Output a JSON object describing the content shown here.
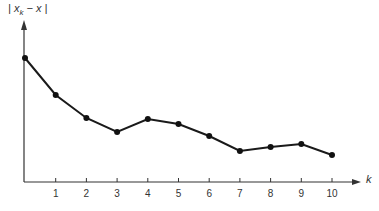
{
  "chart_data": {
    "type": "line",
    "title": "",
    "xlabel": "k",
    "ylabel": "|x_k − x|",
    "x": [
      0,
      1,
      2,
      3,
      4,
      5,
      6,
      7,
      8,
      9,
      10
    ],
    "categories": [
      "",
      "1",
      "2",
      "3",
      "4",
      "5",
      "6",
      "7",
      "8",
      "9",
      "10"
    ],
    "series": [
      {
        "name": "|x_k − x|",
        "values": [
          12.4,
          8.7,
          6.4,
          5.0,
          6.3,
          5.8,
          4.6,
          3.1,
          3.5,
          3.8,
          2.7
        ]
      }
    ],
    "ylim": [
      0,
      18
    ],
    "xlim": [
      0,
      10.5
    ],
    "grid": false,
    "legend": "none",
    "y_ticks": [],
    "x_ticks": [
      "1",
      "2",
      "3",
      "4",
      "5",
      "6",
      "7",
      "8",
      "9",
      "10"
    ],
    "colors": {
      "line": "#1a1a1a",
      "axis": "#333333",
      "marker": "#111111"
    }
  },
  "labels": {
    "y_axis_main": "| x",
    "y_axis_sub": "k",
    "y_axis_tail": " − x |",
    "x_axis": "k"
  }
}
